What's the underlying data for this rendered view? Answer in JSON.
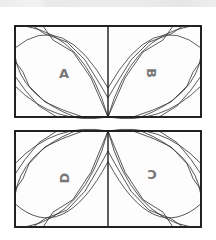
{
  "diagram": {
    "type": "quilt-block-piecing-pattern",
    "blocks": [
      {
        "id": "top-block",
        "panels": [
          {
            "label": "A",
            "rotation": 0
          },
          {
            "label": "B",
            "rotation": 90
          }
        ]
      },
      {
        "id": "bottom-block",
        "panels": [
          {
            "label": "D",
            "rotation": -90
          },
          {
            "label": "C",
            "rotation": 180
          }
        ]
      }
    ],
    "colors": {
      "line": "#1a1a1a",
      "letter": "#777777",
      "background": "#ffffff"
    }
  },
  "labels": {
    "a": "A",
    "b": "B",
    "c": "C",
    "d": "D"
  }
}
